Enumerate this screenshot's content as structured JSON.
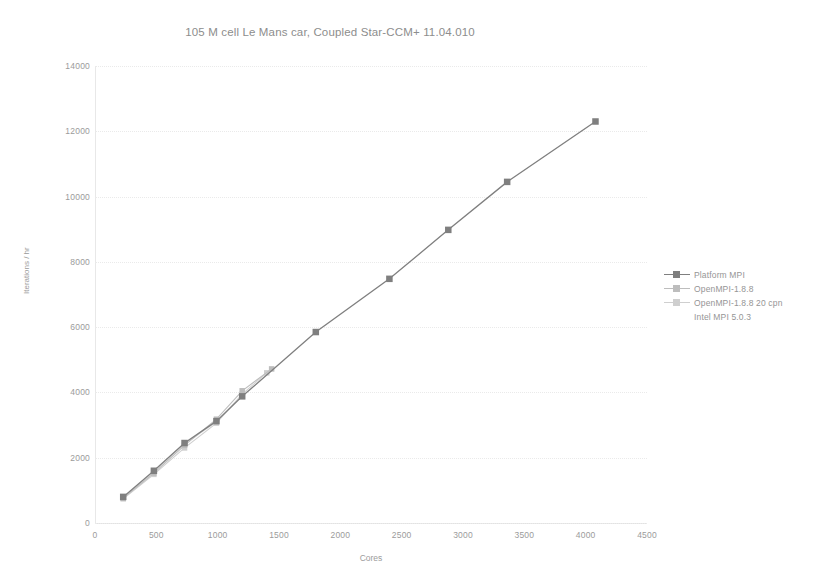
{
  "chart_data": {
    "type": "line",
    "title": "105 M cell Le Mans car, Coupled Star-CCM+ 11.04.010",
    "xlabel": "Cores",
    "ylabel": "Iterations / hr",
    "xlim": [
      0,
      4500
    ],
    "ylim": [
      0,
      14000
    ],
    "xticks": [
      0,
      500,
      1000,
      1500,
      2000,
      2500,
      3000,
      3500,
      4000,
      4500
    ],
    "yticks": [
      0,
      2000,
      4000,
      6000,
      8000,
      10000,
      12000,
      14000
    ],
    "grid": true,
    "legend_position": "right",
    "series": [
      {
        "name": "Platform MPI",
        "color": "#7f7f7f",
        "marker": "square",
        "x": [
          230,
          480,
          730,
          990,
          1200,
          1800,
          2400,
          2880,
          3360,
          4080
        ],
        "y": [
          800,
          1600,
          2450,
          3120,
          3880,
          5850,
          7480,
          8980,
          10450,
          12300
        ]
      },
      {
        "name": "OpenMPI-1.8.8",
        "color": "#bdbdbd",
        "marker": "square",
        "x": [
          230,
          480,
          730,
          990,
          1200,
          1440
        ],
        "y": [
          760,
          1530,
          2380,
          3180,
          4050,
          4720
        ]
      },
      {
        "name": "OpenMPI-1.8.8 20 cpn",
        "color": "#cfcfcf",
        "marker": "square",
        "x": [
          230,
          480,
          730,
          990,
          1200,
          1400
        ],
        "y": [
          740,
          1490,
          2300,
          3060,
          3950,
          4600
        ]
      },
      {
        "name": "Intel MPI 5.0.3",
        "color": "#dcdcdc",
        "marker": "none",
        "x": [
          230,
          480,
          730,
          990,
          1200
        ],
        "y": [
          780,
          1560,
          2420,
          3100,
          3900
        ]
      }
    ]
  },
  "legend": {
    "items": [
      {
        "label": "Platform MPI",
        "color": "#7f7f7f",
        "has_marker": true,
        "has_line": true
      },
      {
        "label": "OpenMPI-1.8.8",
        "color": "#bdbdbd",
        "has_marker": true,
        "has_line": true
      },
      {
        "label": "OpenMPI-1.8.8 20 cpn",
        "color": "#cfcfcf",
        "has_marker": true,
        "has_line": true
      },
      {
        "label": "Intel MPI 5.0.3",
        "color": "#dcdcdc",
        "has_marker": false,
        "has_line": false
      }
    ]
  }
}
